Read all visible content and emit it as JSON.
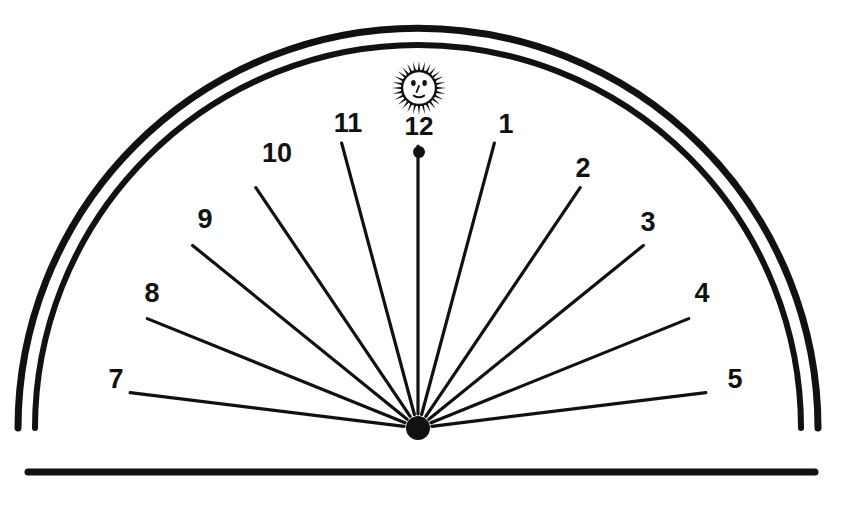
{
  "figure": {
    "background_color": "#ffffff",
    "ink_color": "#111111",
    "width": 841,
    "height": 509
  },
  "dial": {
    "shape": "semicircle",
    "border_style": "double-arc",
    "center": {
      "x": 418,
      "y": 428
    },
    "baseline": {
      "y": 472,
      "x_start": 28,
      "x_end": 815
    },
    "outer_arc_radius": 400,
    "inner_arc_radius": 383,
    "hub_radius": 12
  },
  "sun": {
    "emblem_name": "sun-face-emblem",
    "center": {
      "x": 419,
      "y": 88
    },
    "ray_count": 28,
    "core_radius": 17,
    "ray_length": 10
  },
  "noon_marker": {
    "name": "noon-dot",
    "x": 419,
    "y": 152,
    "radius": 6
  },
  "hour_lines": [
    {
      "hour": "1",
      "label": "1",
      "angle_deg": 75,
      "inner_radius": 14,
      "outer_radius": 295,
      "label_x": 506,
      "label_y": 126
    },
    {
      "hour": "2",
      "label": "2",
      "angle_deg": 56,
      "inner_radius": 14,
      "outer_radius": 290,
      "label_x": 583,
      "label_y": 170
    },
    {
      "hour": "3",
      "label": "3",
      "angle_deg": 39,
      "inner_radius": 14,
      "outer_radius": 290,
      "label_x": 648,
      "label_y": 224
    },
    {
      "hour": "4",
      "label": "4",
      "angle_deg": 22,
      "inner_radius": 14,
      "outer_radius": 292,
      "label_x": 702,
      "label_y": 295
    },
    {
      "hour": "5",
      "label": "5",
      "angle_deg": 7,
      "inner_radius": 14,
      "outer_radius": 290,
      "label_x": 735,
      "label_y": 381
    },
    {
      "hour": "7",
      "label": "7",
      "angle_deg": 173,
      "inner_radius": 14,
      "outer_radius": 290,
      "label_x": 116,
      "label_y": 381
    },
    {
      "hour": "8",
      "label": "8",
      "angle_deg": 158,
      "inner_radius": 14,
      "outer_radius": 292,
      "label_x": 152,
      "label_y": 295
    },
    {
      "hour": "9",
      "label": "9",
      "angle_deg": 141,
      "inner_radius": 14,
      "outer_radius": 290,
      "label_x": 205,
      "label_y": 221
    },
    {
      "hour": "10",
      "label": "10",
      "angle_deg": 124,
      "inner_radius": 14,
      "outer_radius": 290,
      "label_x": 277,
      "label_y": 155
    },
    {
      "hour": "11",
      "label": "11",
      "angle_deg": 105,
      "inner_radius": 14,
      "outer_radius": 295,
      "label_x": 348,
      "label_y": 125
    },
    {
      "hour": "12",
      "label": "12",
      "angle_deg": 90,
      "inner_radius": 14,
      "outer_radius": 282,
      "label_x": 419,
      "label_y": 128
    }
  ]
}
